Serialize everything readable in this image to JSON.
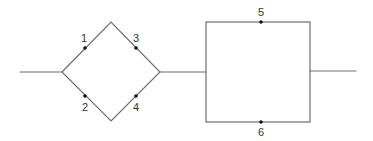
{
  "diagram": {
    "type": "reliability-block-diagram",
    "line_color": "#6e6e6e",
    "node_color": "#111111",
    "stage1": {
      "shape": "diamond-bridge",
      "components": [
        {
          "id": "1",
          "label": "1",
          "branch": "upper-left"
        },
        {
          "id": "2",
          "label": "2",
          "branch": "lower-left"
        },
        {
          "id": "3",
          "label": "3",
          "branch": "upper-right"
        },
        {
          "id": "4",
          "label": "4",
          "branch": "lower-right"
        }
      ]
    },
    "stage2": {
      "shape": "parallel-rectangle",
      "components": [
        {
          "id": "5",
          "label": "5",
          "branch": "top"
        },
        {
          "id": "6",
          "label": "6",
          "branch": "bottom"
        }
      ]
    }
  }
}
